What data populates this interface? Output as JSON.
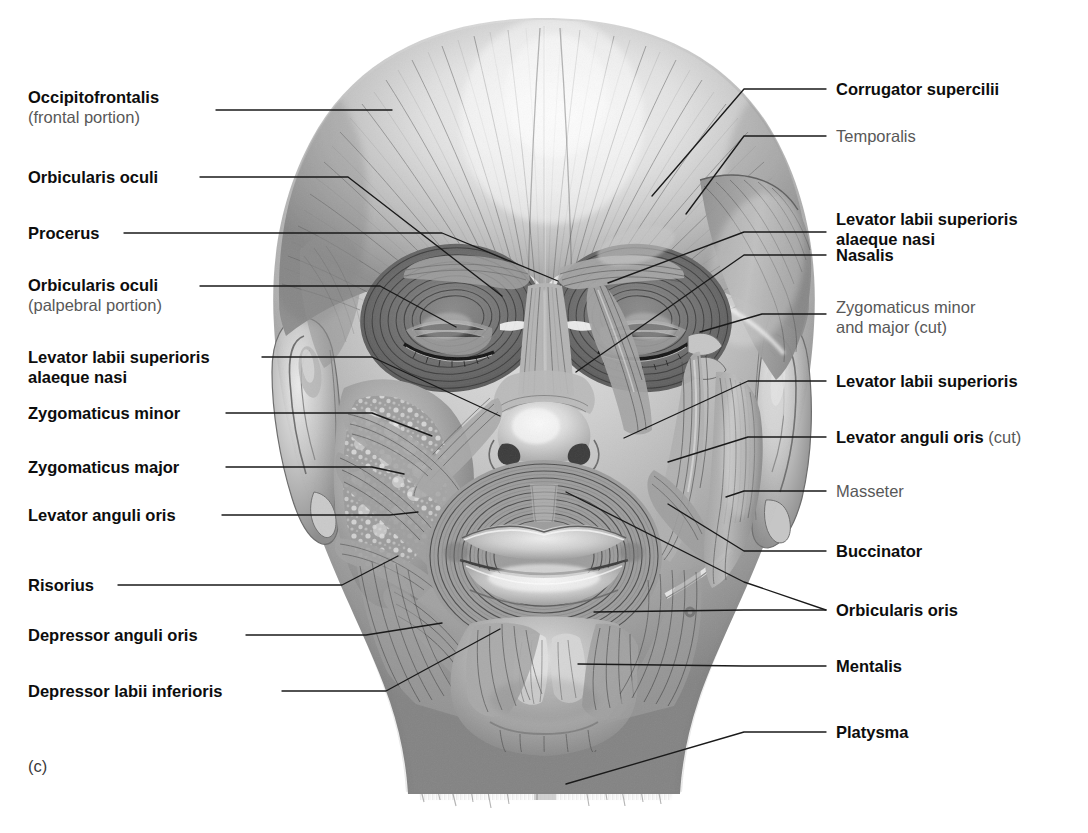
{
  "figure": {
    "caption_letter": "(c)",
    "background_color": "#ffffff",
    "label_color_bold": "#0d0d0d",
    "label_color_gray": "#585858",
    "leader_color": "#1a1a1a"
  },
  "labels_left": [
    {
      "id": "occipitofrontalis",
      "name": "Occipitofrontalis",
      "sub": "(frontal portion)",
      "style": "bold",
      "sub_style": "regular-gray",
      "x": 28,
      "y": 88,
      "leader": {
        "x1": 216,
        "y1": 110,
        "x2": 392,
        "y2": 110,
        "x3": 392,
        "y3": 110
      }
    },
    {
      "id": "orbicularis-oculi",
      "name": "Orbicularis oculi",
      "sub": "",
      "style": "bold",
      "x": 28,
      "y": 168,
      "leader": {
        "x1": 200,
        "y1": 177,
        "x2": 348,
        "y2": 177,
        "x3": 502,
        "y3": 296
      }
    },
    {
      "id": "procerus",
      "name": "Procerus",
      "sub": "",
      "style": "bold",
      "x": 28,
      "y": 224,
      "leader": {
        "x1": 124,
        "y1": 233,
        "x2": 442,
        "y2": 233,
        "x3": 558,
        "y3": 281
      }
    },
    {
      "id": "orbicularis-oculi-palpebral",
      "name": "Orbicularis oculi",
      "sub": "(palpebral portion)",
      "style": "bold",
      "sub_style": "regular-gray",
      "x": 28,
      "y": 276,
      "leader": {
        "x1": 200,
        "y1": 286,
        "x2": 380,
        "y2": 286,
        "x3": 456,
        "y3": 327
      }
    },
    {
      "id": "levator-labii-superioris-alaeque-nasi-left",
      "name": "Levator labii superioris",
      "sub": "alaeque nasi",
      "style": "bold",
      "sub_style": "bold",
      "x": 28,
      "y": 348,
      "leader": {
        "x1": 262,
        "y1": 357,
        "x2": 372,
        "y2": 357,
        "x3": 500,
        "y3": 416
      }
    },
    {
      "id": "zygomaticus-minor-left",
      "name": "Zygomaticus minor",
      "sub": "",
      "style": "bold",
      "x": 28,
      "y": 404,
      "leader": {
        "x1": 226,
        "y1": 413,
        "x2": 372,
        "y2": 413,
        "x3": 432,
        "y3": 436
      }
    },
    {
      "id": "zygomaticus-major-left",
      "name": "Zygomaticus major",
      "sub": "",
      "style": "bold",
      "x": 28,
      "y": 458,
      "leader": {
        "x1": 226,
        "y1": 467,
        "x2": 372,
        "y2": 467,
        "x3": 404,
        "y3": 474
      }
    },
    {
      "id": "levator-anguli-oris-left",
      "name": "Levator anguli oris",
      "sub": "",
      "style": "bold",
      "x": 28,
      "y": 506,
      "leader": {
        "x1": 222,
        "y1": 515,
        "x2": 390,
        "y2": 515,
        "x3": 418,
        "y3": 512
      }
    },
    {
      "id": "risorius",
      "name": "Risorius",
      "sub": "",
      "style": "bold",
      "x": 28,
      "y": 576,
      "leader": {
        "x1": 118,
        "y1": 585,
        "x2": 342,
        "y2": 585,
        "x3": 398,
        "y3": 556
      }
    },
    {
      "id": "depressor-anguli-oris",
      "name": "Depressor anguli oris",
      "sub": "",
      "style": "bold",
      "x": 28,
      "y": 626,
      "leader": {
        "x1": 246,
        "y1": 635,
        "x2": 366,
        "y2": 635,
        "x3": 442,
        "y3": 623
      }
    },
    {
      "id": "depressor-labii-inferioris",
      "name": "Depressor labii inferioris",
      "sub": "",
      "style": "bold",
      "x": 28,
      "y": 682,
      "leader": {
        "x1": 282,
        "y1": 691,
        "x2": 386,
        "y2": 691,
        "x3": 500,
        "y3": 629
      }
    }
  ],
  "labels_right": [
    {
      "id": "corrugator-supercilii",
      "name": "Corrugator supercilii",
      "sub": "",
      "style": "bold",
      "x": 836,
      "y": 80,
      "leader": {
        "x1": 826,
        "y1": 89,
        "x2": 744,
        "y2": 89,
        "x3": 652,
        "y3": 196
      }
    },
    {
      "id": "temporalis",
      "name": "Temporalis",
      "sub": "",
      "style": "gray",
      "x": 836,
      "y": 127,
      "leader": {
        "x1": 826,
        "y1": 136,
        "x2": 744,
        "y2": 136,
        "x3": 686,
        "y3": 214
      }
    },
    {
      "id": "levator-labii-superioris-alaeque-nasi-right",
      "name": "Levator labii superioris",
      "sub": "alaeque nasi",
      "style": "bold",
      "sub_style": "bold",
      "x": 836,
      "y": 210,
      "leader": {
        "x1": 826,
        "y1": 232,
        "x2": 744,
        "y2": 232,
        "x3": 608,
        "y3": 283
      }
    },
    {
      "id": "nasalis",
      "name": "Nasalis",
      "sub": "",
      "style": "bold",
      "x": 836,
      "y": 246,
      "leader": {
        "x1": 826,
        "y1": 255,
        "x2": 744,
        "y2": 255,
        "x3": 576,
        "y3": 372
      }
    },
    {
      "id": "zygomaticus-minor-major-cut",
      "name": "Zygomaticus minor",
      "sub": "and major (cut)",
      "style": "gray",
      "sub_style": "regular-gray",
      "x": 836,
      "y": 298,
      "leader": {
        "x1": 826,
        "y1": 314,
        "x2": 762,
        "y2": 314,
        "x3": 700,
        "y3": 332
      }
    },
    {
      "id": "levator-labii-superioris-right",
      "name": "Levator labii superioris",
      "sub": "",
      "style": "bold",
      "x": 836,
      "y": 372,
      "leader": {
        "x1": 826,
        "y1": 381,
        "x2": 748,
        "y2": 381,
        "x3": 624,
        "y3": 438
      }
    },
    {
      "id": "levator-anguli-oris-cut",
      "name": "Levator anguli oris",
      "sub": "",
      "cut_suffix": "(cut)",
      "style": "bold",
      "x": 836,
      "y": 428,
      "leader": {
        "x1": 826,
        "y1": 437,
        "x2": 748,
        "y2": 437,
        "x3": 668,
        "y3": 462
      }
    },
    {
      "id": "masseter",
      "name": "Masseter",
      "sub": "",
      "style": "gray",
      "x": 836,
      "y": 482,
      "leader": {
        "x1": 826,
        "y1": 491,
        "x2": 744,
        "y2": 491,
        "x3": 726,
        "y3": 497
      }
    },
    {
      "id": "buccinator",
      "name": "Buccinator",
      "sub": "",
      "style": "bold",
      "x": 836,
      "y": 542,
      "leader": {
        "x1": 826,
        "y1": 551,
        "x2": 744,
        "y2": 551,
        "x3": 668,
        "y3": 504
      }
    },
    {
      "id": "orbicularis-oris",
      "name": "Orbicularis oris",
      "sub": "",
      "style": "bold",
      "x": 836,
      "y": 601,
      "leader": {
        "x1": 826,
        "y1": 610,
        "x2": 744,
        "y2": 610,
        "x3": 594,
        "y3": 612
      },
      "leader2": {
        "x1": 826,
        "y1": 610,
        "x2": 744,
        "y2": 582,
        "x3": 566,
        "y3": 492
      }
    },
    {
      "id": "mentalis",
      "name": "Mentalis",
      "sub": "",
      "style": "bold",
      "x": 836,
      "y": 657,
      "leader": {
        "x1": 826,
        "y1": 666,
        "x2": 744,
        "y2": 666,
        "x3": 578,
        "y3": 664
      }
    },
    {
      "id": "platysma",
      "name": "Platysma",
      "sub": "",
      "style": "bold",
      "x": 836,
      "y": 723,
      "leader": {
        "x1": 826,
        "y1": 732,
        "x2": 744,
        "y2": 732,
        "x3": 566,
        "y3": 784
      }
    }
  ],
  "illustration": {
    "description": "Pencil-shaded anterior view of a human head showing superficial muscles of facial expression with fiber striations",
    "regions": [
      "frontalis",
      "orbicularis-oculi-orbital",
      "orbicularis-oculi-palpebral",
      "corrugator-supercilii",
      "procerus",
      "nasalis",
      "levator-labii-superioris",
      "zygomaticus-minor",
      "zygomaticus-major",
      "levator-anguli-oris",
      "risorius",
      "orbicularis-oris",
      "depressor-anguli-oris",
      "depressor-labii-inferioris",
      "mentalis",
      "buccinator",
      "masseter",
      "temporalis",
      "platysma",
      "left-ear",
      "right-ear",
      "nose",
      "lips"
    ]
  }
}
